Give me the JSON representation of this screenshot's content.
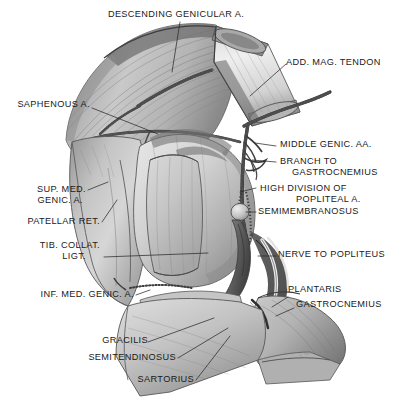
{
  "figure": {
    "background_color": "#ffffff",
    "ink_color": "#1a1a1a",
    "style": "grayscale anatomical illustration",
    "signature": "T. Smith"
  },
  "labels": {
    "descending_genicular_a": "DESCENDING GENICULAR A.",
    "add_mag_tendon": "ADD. MAG. TENDON",
    "saphenous_a": "SAPHENOUS A.",
    "middle_genic_aa": "MIDDLE GENIC. AA.",
    "branch_to": "BRANCH TO",
    "gastrocnemius_upper": "GASTROCNEMIUS",
    "high_division_of": "HIGH DIVISION OF",
    "popliteal_a": "POPLITEAL A.",
    "semimembranosus": "SEMIMEMBRANOSUS",
    "sup_med": "SUP. MED.",
    "genic_a": "GENIC. A.",
    "patellar_ret": "PATELLAR RET.",
    "tib_collat": "TIB. COLLAT.",
    "ligt": "LIGT.",
    "nerve_to_popliteus": "NERVE TO POPLITEUS",
    "inf_med_genic_a": "INF. MED. GENIC. A.",
    "plantaris": "PLANTARIS",
    "gastrocnemius_lower": "GASTROCNEMIUS",
    "gracilis": "GRACILIS",
    "semitendinosus": "SEMITENDINOSUS",
    "sartorius": "SARTORIUS"
  }
}
